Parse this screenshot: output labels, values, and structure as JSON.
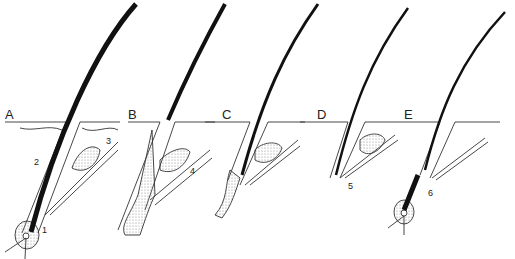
{
  "diagram": {
    "stages": [
      {
        "id": "A",
        "label": "A",
        "x": 5,
        "y": 110
      },
      {
        "id": "B",
        "label": "B",
        "x": 130,
        "y": 110
      },
      {
        "id": "C",
        "label": "C",
        "x": 222,
        "y": 110
      },
      {
        "id": "D",
        "label": "D",
        "x": 317,
        "y": 110
      },
      {
        "id": "E",
        "label": "E",
        "x": 404,
        "y": 110
      }
    ],
    "callouts": [
      {
        "id": "1",
        "label": "1",
        "x": 42,
        "y": 227
      },
      {
        "id": "2",
        "label": "2",
        "x": 34,
        "y": 157
      },
      {
        "id": "3",
        "label": "3",
        "x": 106,
        "y": 138
      },
      {
        "id": "4",
        "label": "4",
        "x": 190,
        "y": 168
      },
      {
        "id": "5",
        "label": "5",
        "x": 348,
        "y": 183
      },
      {
        "id": "6",
        "label": "6",
        "x": 428,
        "y": 190
      }
    ],
    "colors": {
      "ink": "#1a1a1a",
      "stipple": "#bdbdbd",
      "background": "#ffffff"
    }
  }
}
